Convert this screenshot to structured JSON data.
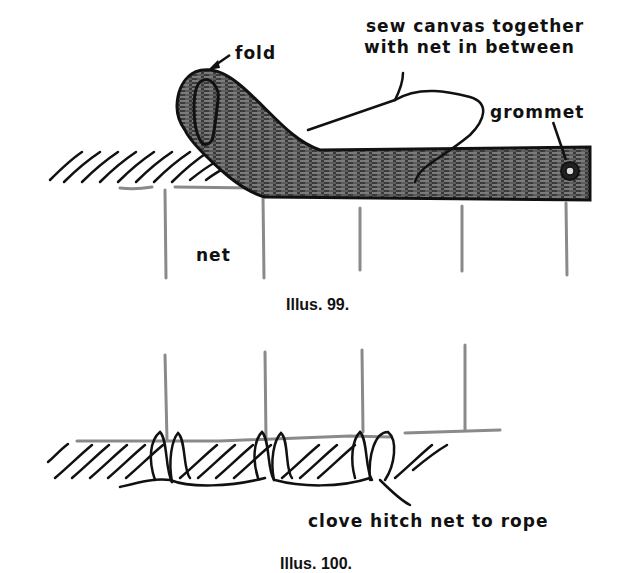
{
  "illus99": {
    "labels": {
      "fold": "fold",
      "sew_line1": "sew canvas together",
      "sew_line2": "with net in between",
      "grommet": "grommet",
      "net": "net"
    },
    "caption": "Illus. 99."
  },
  "illus100": {
    "labels": {
      "clove_hitch": "clove hitch net to rope"
    },
    "caption": "Illus. 100."
  },
  "colors": {
    "ink": "#111111",
    "net_gray": "#8a8a8a",
    "background": "#ffffff"
  }
}
